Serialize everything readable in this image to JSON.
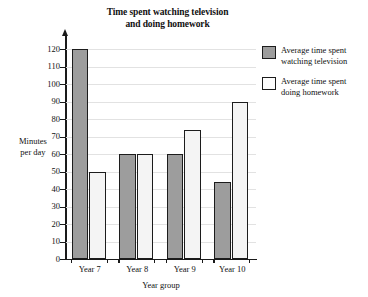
{
  "chart_data": {
    "type": "bar",
    "title": "Time spent watching television and doing homework",
    "title_line1": "Time spent watching television",
    "title_line2": "and doing homework",
    "xlabel": "Year group",
    "ylabel": "Minutes per day",
    "ylabel_line1": "Minutes",
    "ylabel_line2": "per day",
    "categories": [
      "Year 7",
      "Year 8",
      "Year 9",
      "Year 10"
    ],
    "series": [
      {
        "name": "Average time spent watching television",
        "name_line1": "Average time spent",
        "name_line2": "watching television",
        "color": "#9d9d9d",
        "values": [
          120,
          60,
          60,
          44
        ]
      },
      {
        "name": "Average time spent doing homework",
        "name_line1": "Average time spent",
        "name_line2": "doing homework",
        "color": "#f4f4f4",
        "values": [
          50,
          60,
          74,
          90
        ]
      }
    ],
    "ylim": [
      0,
      120
    ],
    "ytick_step": 10,
    "yticks": [
      "0",
      "10",
      "20",
      "30",
      "40",
      "50",
      "60",
      "70",
      "80",
      "90",
      "100",
      "110",
      "120"
    ],
    "grid": true,
    "legend_position": "right"
  }
}
